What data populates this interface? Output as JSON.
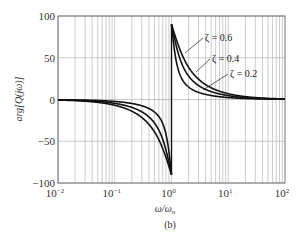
{
  "chart_data": {
    "type": "line",
    "title": "",
    "caption": "(b)",
    "xlabel": "ω/ωn",
    "ylabel": "arg[Q(jω)]",
    "xscale": "log",
    "xlim": [
      0.01,
      100
    ],
    "ylim": [
      -100,
      100
    ],
    "grid": true,
    "x_ticks": [
      "10^-2",
      "10^-1",
      "10^0",
      "10^1",
      "10^2"
    ],
    "y_ticks": [
      100,
      50,
      0,
      -50,
      -100
    ],
    "series": [
      {
        "name": "ζ = 0.6",
        "zeta": 0.6,
        "x": [
          0.01,
          0.1,
          0.3,
          0.5,
          0.8,
          0.95,
          1.0,
          1.05,
          1.25,
          2,
          3,
          10,
          100
        ],
        "values": [
          -0.7,
          -6.9,
          -21.6,
          -38.7,
          -69.4,
          -85.2,
          -90,
          87.0,
          73.3,
          38.7,
          24.2,
          6.9,
          0.7
        ]
      },
      {
        "name": "ζ = 0.4",
        "zeta": 0.4,
        "x": [
          0.01,
          0.1,
          0.3,
          0.5,
          0.8,
          0.95,
          1.0,
          1.05,
          1.25,
          2,
          3,
          10,
          100
        ],
        "values": [
          -0.5,
          -4.6,
          -14.8,
          -28.1,
          -60.6,
          -82.0,
          -90,
          85.2,
          66.0,
          28.1,
          16.7,
          4.6,
          0.5
        ]
      },
      {
        "name": "ζ = 0.2",
        "zeta": 0.2,
        "x": [
          0.01,
          0.1,
          0.3,
          0.5,
          0.8,
          0.95,
          1.0,
          1.05,
          1.25,
          2,
          3,
          10,
          100
        ],
        "values": [
          -0.2,
          -2.3,
          -7.5,
          -14.9,
          -41.6,
          -75.4,
          -90,
          76.4,
          48.0,
          14.9,
          8.5,
          2.3,
          0.2
        ]
      }
    ],
    "annotations": [
      "ζ = 0.6",
      "ζ = 0.4",
      "ζ = 0.2"
    ]
  },
  "labels": {
    "y_ticks": [
      "100",
      "50",
      "0",
      "−50",
      "−100"
    ],
    "x_tick_base": "10",
    "x_tick_exps": [
      "−2",
      "−1",
      "0",
      "1",
      "2"
    ],
    "xlabel_main": "ω/ω",
    "xlabel_sub": "n",
    "ylabel": "arg[Q(jω)]",
    "caption": "(b)",
    "zeta_labels": [
      "ζ = 0.6",
      "ζ = 0.4",
      "ζ = 0.2"
    ]
  }
}
